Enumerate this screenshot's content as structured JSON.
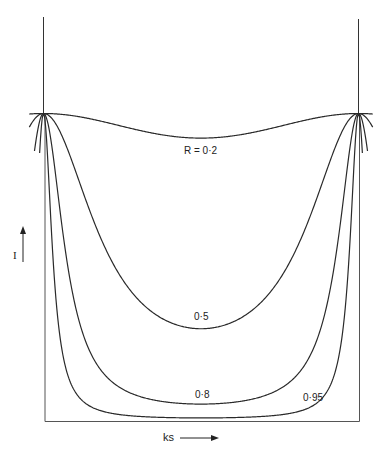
{
  "chart_data": {
    "type": "line",
    "title": "",
    "xlabel": "ks",
    "ylabel": "I",
    "grid": false,
    "legend": "none (curves labelled inline)",
    "x": [
      0,
      0.1,
      0.2,
      0.3,
      0.4,
      0.5,
      0.6,
      0.7,
      0.8,
      0.9,
      1.0
    ],
    "series": [
      {
        "name": "R = 0·2",
        "R": 0.2,
        "label": "R = 0·2",
        "min_relative": 0.92
      },
      {
        "name": "0·5",
        "R": 0.5,
        "label": "0·5",
        "min_relative": 0.3
      },
      {
        "name": "0·8",
        "R": 0.8,
        "label": "0·8",
        "min_relative": 0.055
      },
      {
        "name": "0·95",
        "R": 0.95,
        "label": "0·95",
        "min_relative": 0.01
      }
    ],
    "ylim": [
      0,
      1
    ],
    "xlim": [
      0,
      1
    ]
  },
  "labels": {
    "r02": "R = 0·2",
    "r05": "0·5",
    "r08": "0·8",
    "r095": "0·95",
    "y_axis": "I",
    "x_axis": "ks"
  },
  "colors": {
    "line": "#2a2a2a",
    "background": "#ffffff"
  }
}
